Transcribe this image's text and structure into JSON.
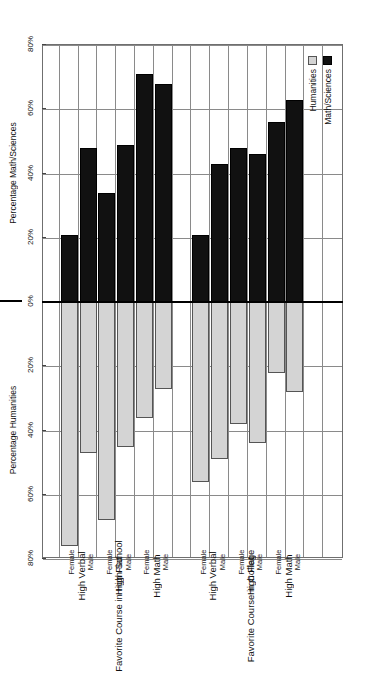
{
  "chart_data": {
    "type": "bar",
    "title": "",
    "subtitle": "",
    "orientation": "horizontal-diverging",
    "xlabel_left": "Percentage Math/Sciences",
    "xlabel_right": "Percentage Humanities",
    "ylabel": "",
    "grid": true,
    "legend_position": "top-left",
    "axis_ticks": [
      "80%",
      "60%",
      "40%",
      "20%",
      "0%",
      "20%",
      "40%",
      "60%",
      "80%"
    ],
    "axis_tick_values": [
      -80,
      -60,
      -40,
      -20,
      0,
      20,
      40,
      60,
      80
    ],
    "xlim": [
      -80,
      80
    ],
    "legend": [
      {
        "name": "Math/Sciences",
        "color": "#111111",
        "side": "left"
      },
      {
        "name": "Humanities",
        "color": "#d4d4d4",
        "side": "right"
      }
    ],
    "group_titles": [
      "Favorite Course in College",
      "Favorite Course in High School"
    ],
    "profile_labels": [
      "High Math",
      "High Flat",
      "High Verbal"
    ],
    "sex_labels": [
      "Male",
      "Female"
    ],
    "categories": [
      "College / High Math / Male",
      "College / High Math / Female",
      "College / High Flat / Male",
      "College / High Flat / Female",
      "College / High Verbal / Male",
      "College / High Verbal / Female",
      "High School / High Math / Male",
      "High School / High Math / Female",
      "High School / High Flat / Male",
      "High School / High Flat / Female",
      "High School / High Verbal / Male",
      "High School / High Verbal / Female"
    ],
    "series": [
      {
        "name": "Math/Sciences",
        "values": [
          63,
          56,
          46,
          48,
          43,
          21,
          68,
          71,
          49,
          34,
          48,
          21
        ]
      },
      {
        "name": "Humanities",
        "values": [
          28,
          22,
          44,
          38,
          49,
          56,
          27,
          36,
          45,
          68,
          47,
          76
        ]
      }
    ],
    "bars": [
      {
        "group": "Favorite Course in College",
        "profile": "High Math",
        "sex": "Male",
        "math_sciences": 63,
        "humanities": 28
      },
      {
        "group": "Favorite Course in College",
        "profile": "High Math",
        "sex": "Female",
        "math_sciences": 56,
        "humanities": 22
      },
      {
        "group": "Favorite Course in College",
        "profile": "High Flat",
        "sex": "Male",
        "math_sciences": 46,
        "humanities": 44
      },
      {
        "group": "Favorite Course in College",
        "profile": "High Flat",
        "sex": "Female",
        "math_sciences": 48,
        "humanities": 38
      },
      {
        "group": "Favorite Course in College",
        "profile": "High Verbal",
        "sex": "Male",
        "math_sciences": 43,
        "humanities": 49
      },
      {
        "group": "Favorite Course in College",
        "profile": "High Verbal",
        "sex": "Female",
        "math_sciences": 21,
        "humanities": 56
      },
      {
        "group": "Favorite Course in High School",
        "profile": "High Math",
        "sex": "Male",
        "math_sciences": 68,
        "humanities": 27
      },
      {
        "group": "Favorite Course in High School",
        "profile": "High Math",
        "sex": "Female",
        "math_sciences": 71,
        "humanities": 36
      },
      {
        "group": "Favorite Course in High School",
        "profile": "High Flat",
        "sex": "Male",
        "math_sciences": 49,
        "humanities": 45
      },
      {
        "group": "Favorite Course in High School",
        "profile": "High Flat",
        "sex": "Female",
        "math_sciences": 34,
        "humanities": 68
      },
      {
        "group": "Favorite Course in High School",
        "profile": "High Verbal",
        "sex": "Male",
        "math_sciences": 48,
        "humanities": 47
      },
      {
        "group": "Favorite Course in High School",
        "profile": "High Verbal",
        "sex": "Female",
        "math_sciences": 21,
        "humanities": 76
      }
    ]
  }
}
